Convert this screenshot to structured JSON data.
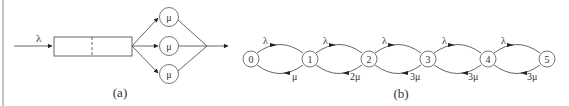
{
  "figure_a": {
    "caption": "(a)",
    "arrival_label": "λ",
    "servers": [
      {
        "label": "μ"
      },
      {
        "label": "μ"
      },
      {
        "label": "μ"
      }
    ]
  },
  "figure_b": {
    "caption": "(b)",
    "states": [
      "0",
      "1",
      "2",
      "3",
      "4",
      "5"
    ],
    "forward_labels": [
      "λ",
      "λ",
      "λ",
      "λ",
      "λ"
    ],
    "backward_labels": [
      "μ",
      "2μ",
      "3μ",
      "3μ",
      "3μ"
    ]
  }
}
